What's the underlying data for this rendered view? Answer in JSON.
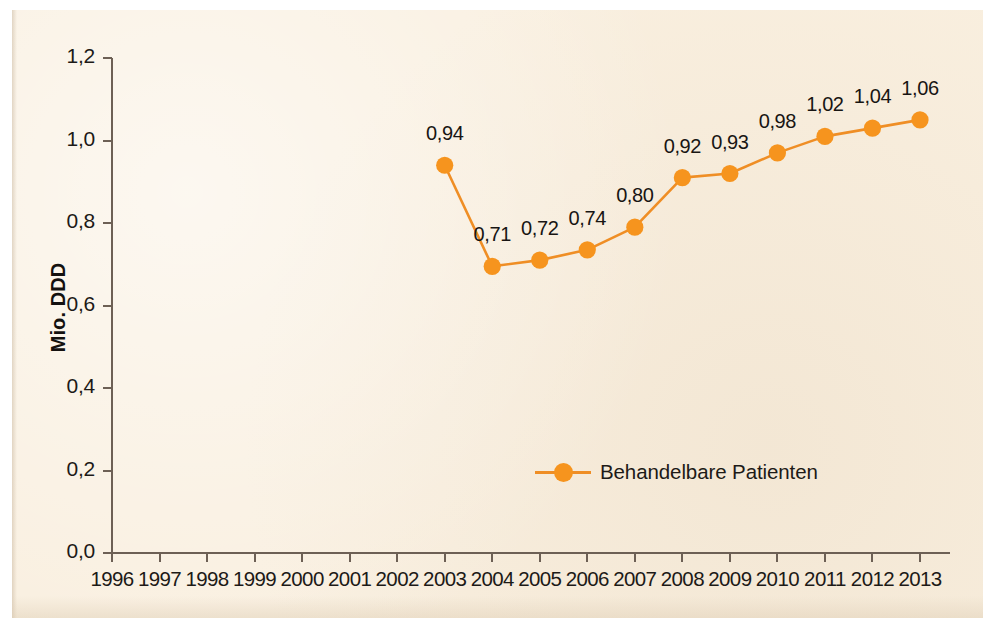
{
  "chart_data": {
    "type": "line",
    "title": "",
    "subtitle": "",
    "xlabel": "",
    "ylabel": "Mio. DDD",
    "x": [
      1996,
      1997,
      1998,
      1999,
      2000,
      2001,
      2002,
      2003,
      2004,
      2005,
      2006,
      2007,
      2008,
      2009,
      2010,
      2011,
      2012,
      2013
    ],
    "xtick_labels": [
      "1996",
      "1997",
      "1998",
      "1999",
      "2000",
      "2001",
      "2002",
      "2003",
      "2004",
      "2005",
      "2006",
      "2007",
      "2008",
      "2009",
      "2010",
      "2011",
      "2012",
      "2013"
    ],
    "ytick_labels": [
      "0,0",
      "0,2",
      "0,4",
      "0,6",
      "0,8",
      "1,0",
      "1,2"
    ],
    "ytick_values": [
      0.0,
      0.2,
      0.4,
      0.6,
      0.8,
      1.0,
      1.2
    ],
    "ylim": [
      0.0,
      1.2
    ],
    "xlim": [
      1996,
      2013
    ],
    "grid": false,
    "legend_position": "inside-bottom-center",
    "series": [
      {
        "name": "Behandelbare Patienten",
        "color": "#f6941e",
        "marker": "circle",
        "x": [
          2003,
          2004,
          2005,
          2006,
          2007,
          2008,
          2009,
          2010,
          2011,
          2012,
          2013
        ],
        "values": [
          0.94,
          0.695,
          0.71,
          0.735,
          0.79,
          0.91,
          0.92,
          0.97,
          1.01,
          1.03,
          1.05
        ],
        "point_labels": [
          "0,94",
          "0,71",
          "0,72",
          "0,74",
          "0,80",
          "0,92",
          "0,93",
          "0,98",
          "1,02",
          "1,04",
          "1,06"
        ]
      }
    ]
  },
  "legend": {
    "entries": [
      {
        "label": "Behandelbare Patienten",
        "color": "#f6941e"
      }
    ]
  },
  "axes": {
    "y_axis_title": "Mio. DDD",
    "axis_color": "#6d6055"
  },
  "colors": {
    "background": "#f9efdf",
    "series_orange": "#f6941e",
    "line_orange": "#ef8e25",
    "text": "#1d1a17",
    "axis": "#6d6055"
  }
}
